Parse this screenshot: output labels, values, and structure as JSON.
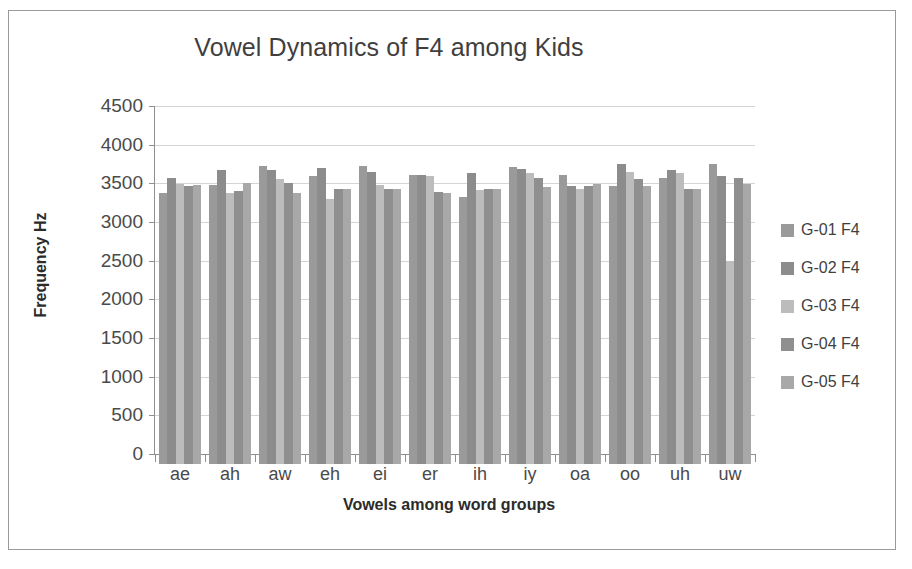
{
  "chart_data": {
    "type": "bar",
    "title": "Vowel Dynamics of F4 among Kids",
    "xlabel": "Vowels among word groups",
    "ylabel": "Frequency Hz",
    "ylim": [
      0,
      4500
    ],
    "ytick_step": 500,
    "yticks": [
      "4500",
      "4000",
      "3500",
      "3000",
      "2500",
      "2000",
      "1500",
      "1000",
      "500",
      "0"
    ],
    "grid": true,
    "legend_position": "right",
    "categories": [
      "ae",
      "ah",
      "aw",
      "eh",
      "ei",
      "er",
      "ih",
      "iy",
      "oa",
      "oo",
      "uh",
      "uw"
    ],
    "series": [
      {
        "name": "G-01 F4",
        "color": "#9a9a9a",
        "values": [
          3500,
          3610,
          3860,
          3720,
          3850,
          3740,
          3450,
          3840,
          3740,
          3600,
          3700,
          3880
        ]
      },
      {
        "name": "G-02 F4",
        "color": "#8c8c8c",
        "values": [
          3700,
          3800,
          3800,
          3830,
          3770,
          3740,
          3760,
          3820,
          3600,
          3880,
          3800,
          3720
        ]
      },
      {
        "name": "G-03 F4",
        "color": "#bcbcbc",
        "values": [
          3620,
          3500,
          3690,
          3430,
          3610,
          3720,
          3540,
          3760,
          3560,
          3780,
          3760,
          2620
        ]
      },
      {
        "name": "G-04 F4",
        "color": "#8f8f8f",
        "values": [
          3600,
          3530,
          3640,
          3560,
          3550,
          3520,
          3560,
          3700,
          3590,
          3690,
          3560,
          3700
        ]
      },
      {
        "name": "G-05 F4",
        "color": "#a8a8a8",
        "values": [
          3610,
          3640,
          3500,
          3560,
          3560,
          3500,
          3560,
          3580,
          3620,
          3600,
          3560,
          3620
        ]
      }
    ]
  },
  "legend": {
    "items": [
      {
        "label": "G-01 F4"
      },
      {
        "label": "G-02 F4"
      },
      {
        "label": "G-03 F4"
      },
      {
        "label": "G-04 F4"
      },
      {
        "label": "G-05 F4"
      }
    ]
  }
}
